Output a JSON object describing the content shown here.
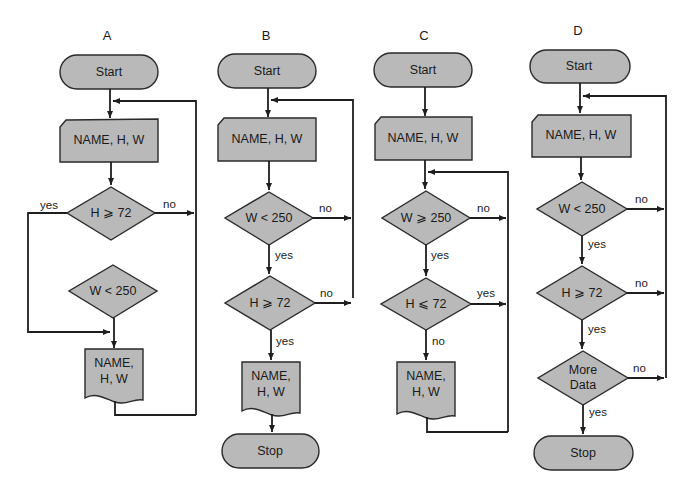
{
  "colors": {
    "shape_fill": "#b9b9b9",
    "stroke": "#1e1e1e",
    "background": "#ffffff"
  },
  "flowcharts": [
    {
      "title": "A",
      "start": "Start",
      "input": "NAME, H, W",
      "decisions": [
        {
          "text": "H ⩾ 72",
          "left_label": "yes",
          "right_label": "no"
        },
        {
          "text": "W < 250"
        }
      ],
      "output": {
        "line1": "NAME,",
        "line2": "H, W"
      }
    },
    {
      "title": "B",
      "start": "Start",
      "input": "NAME, H, W",
      "decisions": [
        {
          "text": "W < 250",
          "down_label": "yes",
          "right_label": "no"
        },
        {
          "text": "H ⩾ 72",
          "down_label": "yes",
          "right_label": "no"
        }
      ],
      "output": {
        "line1": "NAME,",
        "line2": "H, W"
      },
      "stop": "Stop"
    },
    {
      "title": "C",
      "start": "Start",
      "input": "NAME, H, W",
      "decisions": [
        {
          "text": "W ⩾ 250",
          "down_label": "yes",
          "right_label": "no"
        },
        {
          "text": "H ⩽ 72",
          "down_label": "no",
          "right_label": "yes"
        }
      ],
      "output": {
        "line1": "NAME,",
        "line2": "H, W"
      }
    },
    {
      "title": "D",
      "start": "Start",
      "input": "NAME, H, W",
      "decisions": [
        {
          "text": "W < 250",
          "down_label": "yes",
          "right_label": "no"
        },
        {
          "text": "H ⩾ 72",
          "down_label": "yes",
          "right_label": "no"
        },
        {
          "line1": "More",
          "line2": "Data",
          "down_label": "yes",
          "right_label": "no"
        }
      ],
      "stop": "Stop"
    }
  ]
}
